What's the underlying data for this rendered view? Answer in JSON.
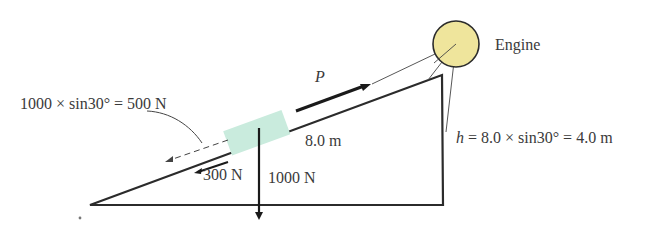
{
  "diagram": {
    "labels": {
      "engine": "Engine",
      "p_force": "P",
      "gravity_component": "1000 × sin30° = 500 N",
      "incline_length": "8.0 m",
      "friction": "300 N",
      "weight": "1000 N",
      "height_prefix": "h",
      "height_formula": " = 8.0 × sin30° = 4.0 m"
    },
    "colors": {
      "line": "#2b2b2b",
      "engine_fill": "#EFE59C",
      "block_fill": "#C9EBDD",
      "text": "#3a3a3a"
    },
    "geometry": {
      "incline_angle_deg": 30,
      "incline_length_m": 8.0,
      "height_m": 4.0,
      "weight_N": 1000,
      "parallel_component_N": 500,
      "friction_N": 300
    }
  }
}
